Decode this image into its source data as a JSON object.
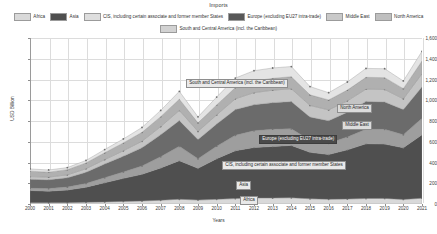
{
  "chart_data": {
    "type": "area",
    "stacked": true,
    "title": "Imports",
    "xlabel": "Years",
    "ylabel": "USD Billion",
    "xlim": [
      2000,
      2021
    ],
    "ylim": [
      0,
      1600
    ],
    "ytick_step": 200,
    "grid": true,
    "legend_position": "top",
    "categories": [
      "2000",
      "2001",
      "2002",
      "2003",
      "2004",
      "2005",
      "2006",
      "2007",
      "2008",
      "2009",
      "2010",
      "2011",
      "2012",
      "2013",
      "2014",
      "2015",
      "2016",
      "2017",
      "2018",
      "2019",
      "2020",
      "2021"
    ],
    "yticks": [
      "0",
      "200",
      "400",
      "600",
      "800",
      "1,000",
      "1,200",
      "1,400",
      "1,600"
    ],
    "series": [
      {
        "name": "Africa",
        "color": "#d9d9d9",
        "values": [
          12,
          12,
          13,
          16,
          20,
          25,
          29,
          36,
          46,
          38,
          45,
          52,
          58,
          58,
          60,
          50,
          45,
          48,
          53,
          54,
          44,
          56
        ]
      },
      {
        "name": "Asia",
        "color": "#4f4f4f",
        "values": [
          118,
          112,
          122,
          146,
          186,
          222,
          258,
          312,
          372,
          306,
          392,
          462,
          487,
          497,
          505,
          448,
          432,
          474,
          528,
          524,
          498,
          612
        ]
      },
      {
        "name": "CIS, including certain associate and former member States",
        "color": "#9e9e9e",
        "values": [
          22,
          25,
          28,
          36,
          48,
          62,
          80,
          108,
          138,
          92,
          120,
          148,
          162,
          166,
          160,
          116,
          108,
          124,
          140,
          142,
          126,
          158
        ]
      },
      {
        "name": "Europe (excluding EU27 intra-trade)",
        "color": "#6b6b6b",
        "values": [
          86,
          84,
          90,
          108,
          132,
          152,
          176,
          212,
          248,
          186,
          214,
          248,
          250,
          256,
          262,
          224,
          218,
          238,
          268,
          264,
          242,
          304
        ]
      },
      {
        "name": "Middle East",
        "color": "#c4c4c4",
        "values": [
          26,
          26,
          28,
          34,
          42,
          52,
          62,
          78,
          98,
          78,
          88,
          104,
          116,
          120,
          124,
          112,
          104,
          110,
          118,
          120,
          104,
          126
        ]
      },
      {
        "name": "North America",
        "color": "#b0b0b0",
        "values": [
          52,
          48,
          50,
          56,
          66,
          76,
          86,
          96,
          108,
          82,
          96,
          108,
          112,
          114,
          116,
          102,
          96,
          104,
          114,
          114,
          98,
          122
        ]
      },
      {
        "name": "South and Central America (incl. the Caribbean)",
        "color": "#e4e4e4",
        "values": [
          22,
          21,
          20,
          24,
          31,
          38,
          47,
          60,
          76,
          58,
          76,
          92,
          100,
          100,
          98,
          80,
          70,
          78,
          86,
          86,
          74,
          94
        ]
      }
    ],
    "totals": [
      338,
      328,
      351,
      420,
      525,
      627,
      738,
      902,
      1086,
      840,
      1031,
      1214,
      1285,
      1311,
      1325,
      1132,
      1073,
      1176,
      1307,
      1304,
      1186,
      1472
    ],
    "annotations": [
      {
        "name": "south-central-america",
        "label": "South and Central America (incl. the Caribbean)",
        "style": "light"
      },
      {
        "name": "north-america",
        "label": "North America",
        "style": "mid"
      },
      {
        "name": "middle-east",
        "label": "Middle East",
        "style": "mid"
      },
      {
        "name": "europe",
        "label": "Europe (excluding EU27 intra-trade)",
        "style": "dark"
      },
      {
        "name": "cis",
        "label": "CIS, including certain associate and former member States",
        "style": "light"
      },
      {
        "name": "asia",
        "label": "Asia",
        "style": "light"
      },
      {
        "name": "africa",
        "label": "Africa",
        "style": "light"
      }
    ]
  },
  "legend": {
    "row1": [
      {
        "label": "Africa",
        "color": "#d9d9d9"
      },
      {
        "label": "Asia",
        "color": "#4f4f4f"
      },
      {
        "label": "CIS, including certain associate and former member States",
        "color": "#dedede"
      },
      {
        "label": "Europe (excluding EU27 intra-trade)",
        "color": "#585858"
      },
      {
        "label": "Middle East",
        "color": "#c9c9c9"
      },
      {
        "label": "North America",
        "color": "#bfbfbf"
      }
    ],
    "row2": [
      {
        "label": "South and Central America (incl. the Caribbean)",
        "color": "#d2d2d2"
      }
    ]
  }
}
